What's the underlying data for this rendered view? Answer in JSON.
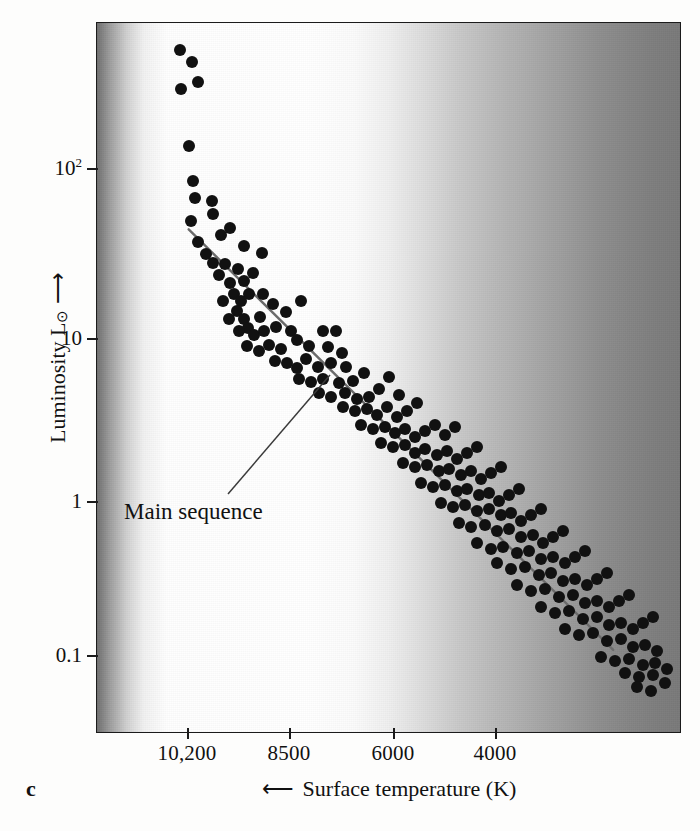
{
  "figure": {
    "panel_label": "c",
    "title": "",
    "plot_area": {
      "left": 96,
      "top": 22,
      "width": 585,
      "height": 711
    }
  },
  "axes": {
    "y": {
      "label_prefix": "Luminosity L",
      "label_sub": "⊙",
      "label_arrow": "⟶",
      "scale": "log",
      "tick_labels": [
        "10",
        "10",
        "1",
        "0.1"
      ],
      "tick_exponents": [
        "2",
        "",
        "",
        ""
      ],
      "tick_values": [
        100,
        10,
        1,
        0.1
      ],
      "tick_pixel_y": [
        168,
        338,
        501,
        655
      ]
    },
    "x": {
      "label": "Surface temperature (K)",
      "arrow": "⟵",
      "direction": "decreasing-left-to-right",
      "tick_labels": [
        "10,200",
        "8500",
        "6000",
        "4000"
      ],
      "tick_values": [
        10200,
        8500,
        6000,
        4000
      ],
      "tick_pixel_x": [
        187,
        289,
        393,
        495
      ]
    }
  },
  "annotations": [
    {
      "name": "main-sequence",
      "text": "Main sequence",
      "x": 124,
      "y": 499
    }
  ],
  "colors": {
    "dot": "#111111",
    "frame": "#1b1b1b",
    "main_sequence_line": "#6b6b6b",
    "leader_line": "#3a3a3a",
    "background_hot_edge": "#6f6f6f",
    "background_white": "#ffffff",
    "background_cool_edge": "#797979"
  },
  "chart_data": {
    "type": "scatter",
    "title": "",
    "xlabel": "Surface temperature (K)",
    "ylabel": "Luminosity L⊙",
    "xscale": "linear-reversed",
    "yscale": "log",
    "xlim": [
      11000,
      2900
    ],
    "ylim": [
      0.06,
      700
    ],
    "grid": false,
    "legend": null,
    "xticks": [
      10200,
      8500,
      6000,
      4000
    ],
    "yticks": [
      100,
      10,
      1,
      0.1
    ],
    "series": [
      {
        "name": "Stars",
        "marker": "filled-circle",
        "points_pixel": [
          [
            179,
            49
          ],
          [
            191,
            61
          ],
          [
            197,
            81
          ],
          [
            180,
            88
          ],
          [
            188,
            145
          ],
          [
            192,
            180
          ],
          [
            194,
            197
          ],
          [
            211,
            200
          ],
          [
            190,
            220
          ],
          [
            212,
            213
          ],
          [
            220,
            234
          ],
          [
            197,
            241
          ],
          [
            205,
            253
          ],
          [
            229,
            227
          ],
          [
            243,
            245
          ],
          [
            261,
            252
          ],
          [
            212,
            262
          ],
          [
            224,
            263
          ],
          [
            218,
            274
          ],
          [
            237,
            268
          ],
          [
            229,
            282
          ],
          [
            243,
            280
          ],
          [
            252,
            272
          ],
          [
            248,
            293
          ],
          [
            233,
            293
          ],
          [
            240,
            300
          ],
          [
            262,
            293
          ],
          [
            222,
            300
          ],
          [
            236,
            310
          ],
          [
            243,
            318
          ],
          [
            247,
            327
          ],
          [
            259,
            316
          ],
          [
            272,
            303
          ],
          [
            285,
            311
          ],
          [
            300,
            300
          ],
          [
            228,
            318
          ],
          [
            238,
            330
          ],
          [
            253,
            334
          ],
          [
            263,
            330
          ],
          [
            275,
            326
          ],
          [
            290,
            330
          ],
          [
            246,
            345
          ],
          [
            258,
            350
          ],
          [
            268,
            344
          ],
          [
            280,
            348
          ],
          [
            296,
            339
          ],
          [
            308,
            345
          ],
          [
            322,
            330
          ],
          [
            327,
            346
          ],
          [
            335,
            330
          ],
          [
            341,
            352
          ],
          [
            274,
            360
          ],
          [
            286,
            362
          ],
          [
            296,
            367
          ],
          [
            305,
            358
          ],
          [
            317,
            366
          ],
          [
            330,
            362
          ],
          [
            345,
            366
          ],
          [
            298,
            378
          ],
          [
            310,
            381
          ],
          [
            322,
            378
          ],
          [
            338,
            382
          ],
          [
            352,
            380
          ],
          [
            363,
            372
          ],
          [
            318,
            392
          ],
          [
            330,
            396
          ],
          [
            344,
            392
          ],
          [
            356,
            398
          ],
          [
            368,
            396
          ],
          [
            378,
            388
          ],
          [
            388,
            376
          ],
          [
            398,
            394
          ],
          [
            342,
            406
          ],
          [
            354,
            410
          ],
          [
            366,
            408
          ],
          [
            376,
            414
          ],
          [
            386,
            406
          ],
          [
            396,
            416
          ],
          [
            406,
            410
          ],
          [
            416,
            402
          ],
          [
            360,
            424
          ],
          [
            372,
            428
          ],
          [
            384,
            426
          ],
          [
            394,
            432
          ],
          [
            404,
            428
          ],
          [
            414,
            436
          ],
          [
            424,
            430
          ],
          [
            434,
            424
          ],
          [
            444,
            434
          ],
          [
            454,
            426
          ],
          [
            380,
            442
          ],
          [
            392,
            446
          ],
          [
            404,
            444
          ],
          [
            414,
            452
          ],
          [
            424,
            448
          ],
          [
            436,
            454
          ],
          [
            446,
            450
          ],
          [
            456,
            458
          ],
          [
            466,
            452
          ],
          [
            476,
            446
          ],
          [
            402,
            462
          ],
          [
            414,
            466
          ],
          [
            426,
            464
          ],
          [
            438,
            470
          ],
          [
            448,
            468
          ],
          [
            460,
            474
          ],
          [
            470,
            470
          ],
          [
            480,
            478
          ],
          [
            490,
            472
          ],
          [
            500,
            466
          ],
          [
            420,
            482
          ],
          [
            432,
            486
          ],
          [
            444,
            484
          ],
          [
            456,
            490
          ],
          [
            466,
            488
          ],
          [
            478,
            494
          ],
          [
            488,
            492
          ],
          [
            498,
            500
          ],
          [
            508,
            494
          ],
          [
            518,
            488
          ],
          [
            440,
            502
          ],
          [
            452,
            506
          ],
          [
            464,
            504
          ],
          [
            476,
            510
          ],
          [
            488,
            508
          ],
          [
            500,
            514
          ],
          [
            510,
            512
          ],
          [
            520,
            520
          ],
          [
            530,
            514
          ],
          [
            540,
            508
          ],
          [
            458,
            522
          ],
          [
            470,
            526
          ],
          [
            484,
            524
          ],
          [
            496,
            530
          ],
          [
            508,
            528
          ],
          [
            520,
            536
          ],
          [
            532,
            534
          ],
          [
            542,
            542
          ],
          [
            552,
            536
          ],
          [
            562,
            530
          ],
          [
            476,
            542
          ],
          [
            490,
            548
          ],
          [
            502,
            546
          ],
          [
            516,
            552
          ],
          [
            528,
            550
          ],
          [
            540,
            558
          ],
          [
            552,
            556
          ],
          [
            564,
            562
          ],
          [
            574,
            556
          ],
          [
            584,
            550
          ],
          [
            496,
            562
          ],
          [
            510,
            568
          ],
          [
            524,
            566
          ],
          [
            538,
            574
          ],
          [
            550,
            572
          ],
          [
            562,
            580
          ],
          [
            574,
            578
          ],
          [
            586,
            584
          ],
          [
            596,
            578
          ],
          [
            606,
            572
          ],
          [
            516,
            584
          ],
          [
            530,
            590
          ],
          [
            544,
            588
          ],
          [
            558,
            596
          ],
          [
            572,
            594
          ],
          [
            584,
            602
          ],
          [
            596,
            600
          ],
          [
            608,
            606
          ],
          [
            618,
            600
          ],
          [
            628,
            594
          ],
          [
            540,
            606
          ],
          [
            554,
            612
          ],
          [
            568,
            610
          ],
          [
            582,
            618
          ],
          [
            596,
            616
          ],
          [
            608,
            624
          ],
          [
            620,
            622
          ],
          [
            632,
            628
          ],
          [
            642,
            622
          ],
          [
            652,
            616
          ],
          [
            564,
            628
          ],
          [
            578,
            634
          ],
          [
            592,
            632
          ],
          [
            606,
            640
          ],
          [
            620,
            638
          ],
          [
            632,
            646
          ],
          [
            644,
            644
          ],
          [
            656,
            650
          ],
          [
            600,
            656
          ],
          [
            614,
            660
          ],
          [
            628,
            658
          ],
          [
            642,
            664
          ],
          [
            654,
            662
          ],
          [
            666,
            668
          ],
          [
            624,
            672
          ],
          [
            638,
            676
          ],
          [
            652,
            674
          ],
          [
            664,
            682
          ],
          [
            636,
            686
          ],
          [
            650,
            690
          ]
        ],
        "notes": "Pixel coordinates within the 700x831 figure; hot luminous stars upper-left, cool dim stars lower-right."
      }
    ],
    "fit_line": {
      "name": "Main sequence",
      "from_pixel": [
        188,
        229
      ],
      "to_pixel": [
        614,
        651
      ],
      "color": "#6b6b6b"
    }
  }
}
